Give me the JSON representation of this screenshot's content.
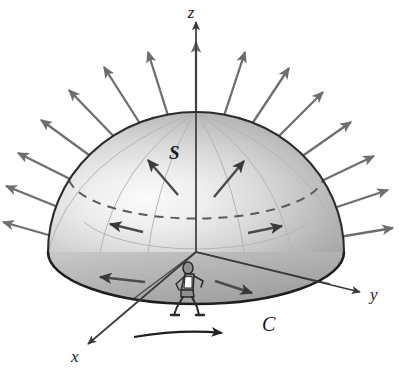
{
  "figure": {
    "background_color": "#ffffff",
    "width": 399,
    "height": 377
  },
  "labels": {
    "z_axis": "z",
    "y_axis": "y",
    "x_axis": "x",
    "surface": "S",
    "curve": "C"
  },
  "colors": {
    "axis": "#3a3a3a",
    "normal_vector": "#6e6e6e",
    "surface_light": "#f2f2f2",
    "surface_mid": "#cfcfcf",
    "surface_dark": "#a8a8a8",
    "outline": "#2b2b2b",
    "dashed_latitude": "#5a5a5a",
    "grid_line": "#b0b0b0",
    "text": "#1a1a1a",
    "figure_fill": "#8f8f8f"
  },
  "geometry": {
    "origin": {
      "x": 196,
      "y": 252
    },
    "dome_apex_y": 112,
    "base_rx": 148,
    "base_ry": 52,
    "dome_ry": 140
  },
  "normal_vectors": [
    {
      "angle_deg": 90,
      "label": "normal-up"
    },
    {
      "angle_deg": 101,
      "label": "normal-up-left-1"
    },
    {
      "angle_deg": 113,
      "label": "normal-up-left-2"
    },
    {
      "angle_deg": 125,
      "label": "normal-up-left-3"
    },
    {
      "angle_deg": 137,
      "label": "normal-left-1"
    },
    {
      "angle_deg": 149,
      "label": "normal-left-2"
    },
    {
      "angle_deg": 161,
      "label": "normal-left-3"
    },
    {
      "angle_deg": 173,
      "label": "normal-left-4"
    },
    {
      "angle_deg": 79,
      "label": "normal-up-right-1"
    },
    {
      "angle_deg": 67,
      "label": "normal-up-right-2"
    },
    {
      "angle_deg": 55,
      "label": "normal-up-right-3"
    },
    {
      "angle_deg": 43,
      "label": "normal-right-1"
    },
    {
      "angle_deg": 31,
      "label": "normal-right-2"
    },
    {
      "angle_deg": 19,
      "label": "normal-right-3"
    },
    {
      "angle_deg": 7,
      "label": "normal-right-4"
    }
  ],
  "surface_vectors": [
    {
      "label": "surface-normal-inner-left-upper"
    },
    {
      "label": "surface-normal-inner-right-upper"
    },
    {
      "label": "surface-normal-inner-left-mid"
    },
    {
      "label": "surface-normal-inner-right-mid"
    },
    {
      "label": "surface-normal-inner-left-lower"
    },
    {
      "label": "surface-normal-inner-right-lower"
    }
  ],
  "orientation_arrow": {
    "description": "horizontal direction-of-travel arrow beneath boundary curve"
  },
  "walking_figure": {
    "description": "person walking along the boundary curve C"
  }
}
